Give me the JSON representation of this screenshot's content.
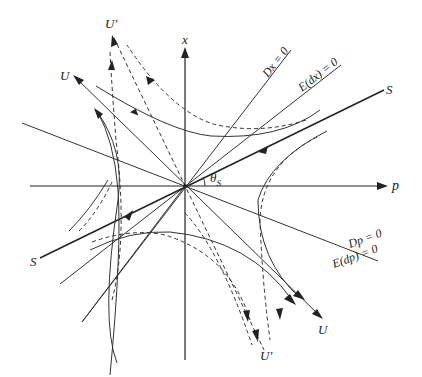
{
  "figure": {
    "type": "phase-portrait",
    "axes": {
      "horizontal_label": "p",
      "vertical_label": "x"
    },
    "angle_label": "θ",
    "angle_subscript": "S",
    "lines": {
      "dx_zero": "Dx = 0",
      "edx_zero": "E(dx) = 0",
      "dp_zero": "Dp = 0",
      "edp_zero": "E(dp) = 0",
      "stable_arm": "S",
      "stable_arm_lower": "S",
      "unstable_arm_upper": "U",
      "unstable_arm_lower": "U",
      "unstable_prime_upper": "U'",
      "unstable_prime_lower": "U'"
    },
    "colors": {
      "ink": "#222222",
      "background": "#ffffff"
    }
  }
}
